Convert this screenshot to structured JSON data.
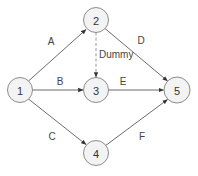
{
  "diagram": {
    "type": "activity-on-arrow network",
    "colors": {
      "edge": "#5a5a5a",
      "dummy_edge": "#8a8a8a",
      "node_fill": "#f3f3f3",
      "node_stroke": "#8c8c8c",
      "text": "#333333"
    },
    "nodes": [
      {
        "id": "1",
        "label": "1",
        "x": 20,
        "y": 90
      },
      {
        "id": "2",
        "label": "2",
        "x": 96,
        "y": 20
      },
      {
        "id": "3",
        "label": "3",
        "x": 96,
        "y": 90
      },
      {
        "id": "4",
        "label": "4",
        "x": 96,
        "y": 153
      },
      {
        "id": "5",
        "label": "5",
        "x": 177,
        "y": 90
      }
    ],
    "edges": [
      {
        "from": "1",
        "to": "2",
        "label": "A",
        "style": "solid"
      },
      {
        "from": "1",
        "to": "3",
        "label": "B",
        "style": "solid"
      },
      {
        "from": "1",
        "to": "4",
        "label": "C",
        "style": "solid"
      },
      {
        "from": "2",
        "to": "5",
        "label": "D",
        "style": "solid"
      },
      {
        "from": "3",
        "to": "5",
        "label": "E",
        "style": "solid"
      },
      {
        "from": "4",
        "to": "5",
        "label": "F",
        "style": "solid"
      },
      {
        "from": "2",
        "to": "3",
        "label": "Dummy",
        "style": "dashed"
      }
    ],
    "labels": {
      "A": "A",
      "B": "B",
      "C": "C",
      "D": "D",
      "E": "E",
      "F": "F",
      "dummy": "Dummy"
    },
    "node_labels": {
      "n1": "1",
      "n2": "2",
      "n3": "3",
      "n4": "4",
      "n5": "5"
    }
  }
}
